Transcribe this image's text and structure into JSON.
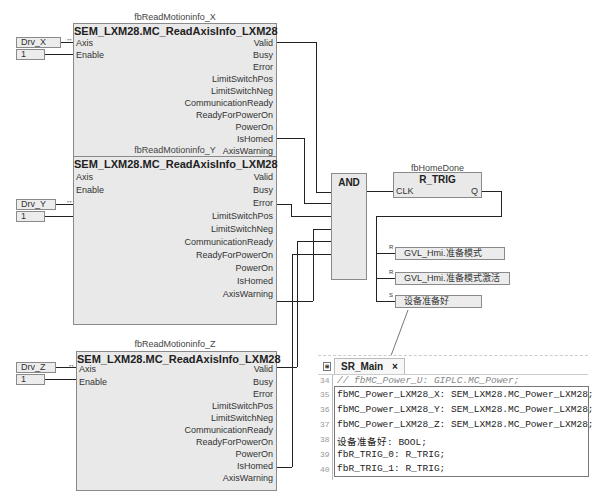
{
  "blocks": [
    {
      "instance": "fbReadMotioninfo_X",
      "type": "SEM_LXM28.MC_ReadAxisInfo_LXM28",
      "inputs": [
        {
          "pin": "Axis",
          "var": "Drv_X"
        },
        {
          "pin": "Enable",
          "var": "1"
        }
      ],
      "outputs": [
        "Valid",
        "Busy",
        "Error",
        "LimitSwitchPos",
        "LimitSwitchNeg",
        "CommunicationReady",
        "ReadyForPowerOn",
        "PowerOn",
        "IsHomed",
        "AxisWarning"
      ]
    },
    {
      "instance": "fbReadMotioninfo_Y",
      "type": "SEM_LXM28.MC_ReadAxisInfo_LXM28",
      "inputs": [
        {
          "pin": "Axis",
          "var": "Drv_Y"
        },
        {
          "pin": "Enable",
          "var": "1"
        }
      ],
      "outputs": [
        "Valid",
        "Busy",
        "Error",
        "LimitSwitchPos",
        "LimitSwitchNeg",
        "CommunicationReady",
        "ReadyForPowerOn",
        "PowerOn",
        "IsHomed",
        "AxisWarning"
      ]
    },
    {
      "instance": "fbReadMotioninfo_Z",
      "type": "SEM_LXM28.MC_ReadAxisInfo_LXM28",
      "inputs": [
        {
          "pin": "Axis",
          "var": "Drv_Z"
        },
        {
          "pin": "Enable",
          "var": "1"
        }
      ],
      "outputs": [
        "Valid",
        "Busy",
        "Error",
        "LimitSwitchPos",
        "LimitSwitchNeg",
        "CommunicationReady",
        "ReadyForPowerOn",
        "PowerOn",
        "IsHomed",
        "AxisWarning"
      ]
    }
  ],
  "axis_marker": "↔",
  "and_block": {
    "label": "AND"
  },
  "trig_block": {
    "instance": "fbHomeDone",
    "type": "R_TRIG",
    "input": "CLK",
    "output": "Q"
  },
  "coils": [
    {
      "mode": "R",
      "var": "GVL_Hmi.准备模式"
    },
    {
      "mode": "R",
      "var": "GVL_Hmi.准备模式激活"
    },
    {
      "mode": "S",
      "var": "设备准备好"
    }
  ],
  "editor": {
    "tab_label": "SR_Main",
    "tab_close": "×",
    "lines": [
      {
        "num": "34",
        "text": "//  fbMC_Power_U: GIPLC.MC_Power;"
      },
      {
        "num": "35",
        "text": "fbMC_Power_LXM28_X: SEM_LXM28.MC_Power_LXM28;"
      },
      {
        "num": "36",
        "text": "fbMC_Power_LXM28_Y: SEM_LXM28.MC_Power_LXM28;"
      },
      {
        "num": "37",
        "text": "fbMC_Power_LXM28_Z: SEM_LXM28.MC_Power_LXM28;"
      },
      {
        "num": "38",
        "text": "设备准备好: BOOL;"
      },
      {
        "num": "39",
        "text": "fbR_TRIG_0: R_TRIG;"
      },
      {
        "num": "40",
        "text": "fbR_TRIG_1: R_TRIG;"
      }
    ]
  }
}
